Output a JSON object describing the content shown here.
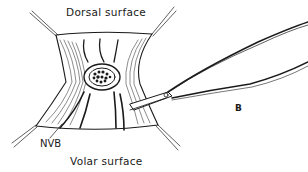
{
  "diagram": {
    "type": "surgical-illustration",
    "labels": {
      "dorsal": "Dorsal surface",
      "volar": "Volar surface",
      "nvb": "NVB",
      "instrument": "B"
    },
    "colors": {
      "ink": "#1a1a1a",
      "background": "#ffffff"
    }
  }
}
